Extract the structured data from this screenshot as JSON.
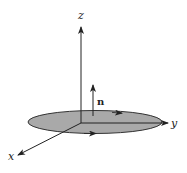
{
  "figure": {
    "type": "3d-coordinate-diagram",
    "colors": {
      "line": "#222222",
      "disk_fill": "#a9a9a9",
      "background": "#ffffff"
    }
  },
  "axes": {
    "x": {
      "label": "x"
    },
    "y": {
      "label": "y"
    },
    "z": {
      "label": "z"
    }
  },
  "normal_vector": {
    "label": "n"
  },
  "disk": {
    "orientation": "counterclockwise-from-above"
  }
}
